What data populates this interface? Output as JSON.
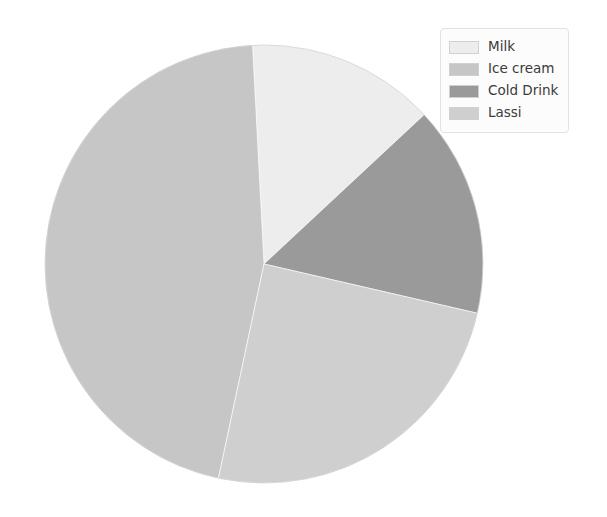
{
  "chart_data": {
    "type": "pie",
    "title": "",
    "categories": [
      "Milk",
      "Ice cream",
      "Cold Drink",
      "Lassi"
    ],
    "values": [
      14,
      46,
      15,
      25
    ],
    "units": "percent",
    "legend_position": "upper right",
    "grid": false,
    "slice_colors": [
      "#ededed",
      "#c6c6c6",
      "#9a9a9a",
      "#cfcfcf"
    ],
    "start_angle": 90,
    "direction": "counterclockwise",
    "slices": [
      {
        "label": "Milk",
        "value": 14,
        "color": "#ededed",
        "start_deg": -3,
        "end_deg": 47
      },
      {
        "label": "Ice cream",
        "value": 46,
        "color": "#c6c6c6",
        "start_deg": 192,
        "end_deg": 357
      },
      {
        "label": "Cold Drink",
        "value": 15,
        "color": "#9a9a9a",
        "start_deg": 47,
        "end_deg": 103
      },
      {
        "label": "Lassi",
        "value": 25,
        "color": "#cfcfcf",
        "start_deg": 103,
        "end_deg": 192
      }
    ],
    "geometry": {
      "center_x": 264,
      "center_y": 264,
      "radius": 219
    }
  },
  "legend": {
    "items": [
      {
        "label": "Milk",
        "color": "#ededed"
      },
      {
        "label": "Ice cream",
        "color": "#c6c6c6"
      },
      {
        "label": "Cold Drink",
        "color": "#9a9a9a"
      },
      {
        "label": "Lassi",
        "color": "#cfcfcf"
      }
    ]
  },
  "figure": {
    "background": "#ffffff",
    "edge_color": "#b8b8b8"
  }
}
